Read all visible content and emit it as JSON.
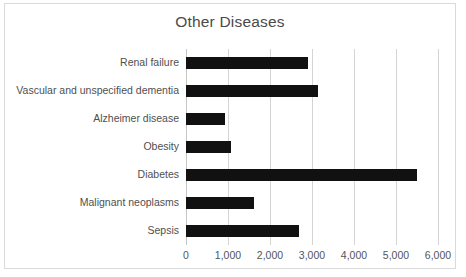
{
  "chart_data": {
    "type": "bar",
    "orientation": "horizontal",
    "title": "Other Diseases",
    "xlabel": "",
    "ylabel": "",
    "categories": [
      "Renal failure",
      "Vascular and unspecified dementia",
      "Alzheimer disease",
      "Obesity",
      "Diabetes",
      "Malignant neoplasms",
      "Sepsis"
    ],
    "values": [
      2900,
      3150,
      920,
      1080,
      5500,
      1620,
      2700
    ],
    "xlim": [
      0,
      6000
    ],
    "xticks": [
      0,
      1000,
      2000,
      3000,
      4000,
      5000,
      6000
    ],
    "xtick_labels": [
      "0",
      "1,000",
      "2,000",
      "3,000",
      "4,000",
      "5,000",
      "6,000"
    ],
    "grid": true,
    "legend": false,
    "bar_color": "#111111",
    "gridline_color": "#d4d4d4",
    "title_color": "#4a4a4a",
    "border_color": "#d9d9d9"
  }
}
